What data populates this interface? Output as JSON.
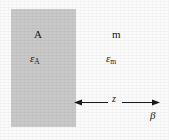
{
  "figure": {
    "type": "physics-geometry-diagram",
    "background_color": "#fbfbfb",
    "slab": {
      "name": "medium A slab",
      "fill_color": "#c9c9c9",
      "region_label": "A",
      "permittivity_symbol": "ε",
      "permittivity_subscript": "A"
    },
    "medium": {
      "name": "medium m",
      "region_label": "m",
      "permittivity_symbol": "ε",
      "permittivity_subscript": "m"
    },
    "separation": {
      "name": "separation distance",
      "label": "z",
      "arrow_style": "double-headed"
    },
    "boundary": {
      "name": "beta surface",
      "label": "β"
    }
  }
}
